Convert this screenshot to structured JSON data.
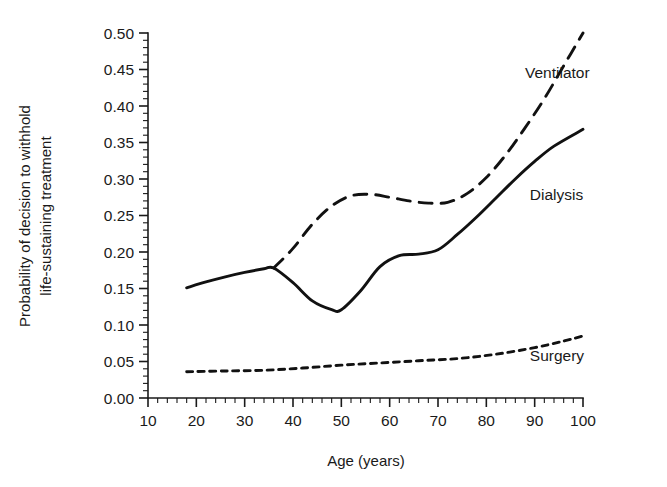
{
  "chart_data": {
    "type": "line",
    "title": "",
    "xlabel": "Age (years)",
    "ylabel": "Probability of decision to withhold life-sustaining treatment",
    "ylabel_line1": "Probability of decision to withhold",
    "ylabel_line2": "life-sustaining treatment",
    "xlim": [
      10,
      100
    ],
    "ylim": [
      0.0,
      0.5
    ],
    "grid": false,
    "legend_position": "inline-right-labels",
    "x_ticks": [
      10,
      20,
      30,
      40,
      50,
      60,
      70,
      80,
      90,
      100
    ],
    "x_tick_labels": [
      "10",
      "20",
      "30",
      "40",
      "50",
      "60",
      "70",
      "80",
      "90",
      "100"
    ],
    "x_minor_tick_step": 2,
    "y_ticks": [
      0.0,
      0.05,
      0.1,
      0.15,
      0.2,
      0.25,
      0.3,
      0.35,
      0.4,
      0.45,
      0.5
    ],
    "y_tick_labels": [
      "0.00",
      "0.05",
      "0.10",
      "0.15",
      "0.20",
      "0.25",
      "0.30",
      "0.35",
      "0.40",
      "0.45",
      "0.50"
    ],
    "y_minor_tick_step": 0.01,
    "series": [
      {
        "name": "Ventilator",
        "style": "dashed",
        "color": "#111111",
        "label_x": 88,
        "label_y": 0.445,
        "x": [
          36,
          40,
          44,
          48,
          52,
          56,
          60,
          64,
          68,
          72,
          76,
          80,
          84,
          88,
          92,
          96,
          100
        ],
        "values": [
          0.178,
          0.205,
          0.238,
          0.263,
          0.277,
          0.279,
          0.275,
          0.27,
          0.267,
          0.268,
          0.28,
          0.302,
          0.333,
          0.37,
          0.41,
          0.455,
          0.5
        ]
      },
      {
        "name": "Dialysis",
        "style": "solid",
        "color": "#111111",
        "label_x": 89,
        "label_y": 0.278,
        "x": [
          18,
          22,
          26,
          30,
          34,
          36,
          40,
          44,
          48,
          50,
          54,
          58,
          62,
          66,
          70,
          74,
          78,
          82,
          86,
          90,
          94,
          100
        ],
        "values": [
          0.151,
          0.159,
          0.166,
          0.172,
          0.177,
          0.178,
          0.158,
          0.133,
          0.121,
          0.121,
          0.147,
          0.18,
          0.195,
          0.197,
          0.203,
          0.224,
          0.248,
          0.274,
          0.3,
          0.324,
          0.345,
          0.368
        ]
      },
      {
        "name": "Surgery",
        "style": "dotted",
        "color": "#111111",
        "label_x": 89,
        "label_y": 0.057,
        "x": [
          18,
          26,
          34,
          42,
          50,
          58,
          66,
          74,
          82,
          90,
          96,
          100
        ],
        "values": [
          0.036,
          0.037,
          0.038,
          0.041,
          0.045,
          0.048,
          0.051,
          0.054,
          0.06,
          0.069,
          0.078,
          0.085
        ]
      }
    ]
  },
  "labels": {
    "ventilator": "Ventilator",
    "dialysis": "Dialysis",
    "surgery": "Surgery"
  }
}
